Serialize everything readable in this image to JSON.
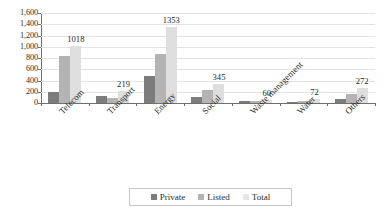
{
  "chart_data": {
    "type": "bar",
    "title": "",
    "subtitle": "",
    "xlabel": "",
    "ylabel": "",
    "ylim": [
      0,
      1600
    ],
    "yticks": [
      "0",
      "200",
      "400",
      "600",
      "800",
      "1,000",
      "1,200",
      "1,400",
      "1,600"
    ],
    "ytick_values": [
      0,
      200,
      400,
      600,
      800,
      1000,
      1200,
      1400,
      1600
    ],
    "grid": true,
    "grid_axis": "y",
    "legend_position": "bottom",
    "orientation": "vertical",
    "grouping": "grouped",
    "categories": [
      "Telecom",
      "Transport",
      "Energy",
      "Social",
      "Waste management",
      "Water",
      "Others"
    ],
    "series": [
      {
        "name": "Private",
        "color": "#7c7c7c",
        "values": [
          190,
          132,
          480,
          103,
          30,
          20,
          68
        ]
      },
      {
        "name": "Listed",
        "color": "#b4b4b4",
        "values": [
          828,
          87,
          873,
          229,
          35,
          40,
          156
        ]
      },
      {
        "name": "Total",
        "color": "#dedede",
        "values": [
          1018,
          219,
          1353,
          345,
          60,
          72,
          272
        ]
      }
    ],
    "data_labels": {
      "series": "Total",
      "values": [
        "1018",
        "219",
        "1353",
        "345",
        "60",
        "72",
        "272"
      ]
    }
  },
  "legend": {
    "items": [
      {
        "label": "Private",
        "color": "#7c7c7c"
      },
      {
        "label": "Listed",
        "color": "#b4b4b4"
      },
      {
        "label": "Total",
        "color": "#e6e6e6"
      }
    ]
  }
}
